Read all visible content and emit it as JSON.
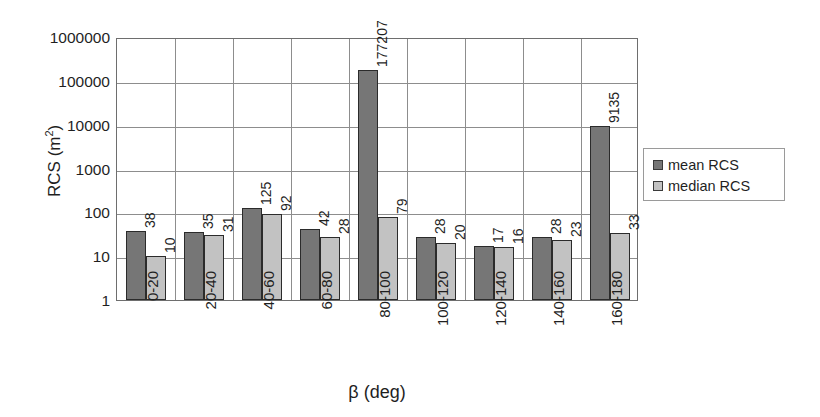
{
  "chart_data": {
    "type": "bar",
    "title": "",
    "xlabel": "β (deg)",
    "ylabel": "RCS (m²)",
    "ylabel_base": "RCS (m",
    "ylabel_sup": "2",
    "ylabel_tail": ")",
    "yscale": "log",
    "ylim": [
      1,
      1000000
    ],
    "ytick_labels": [
      "1000000",
      "100000",
      "10000",
      "1000",
      "100",
      "10",
      "1"
    ],
    "ytick_values": [
      1000000,
      100000,
      10000,
      1000,
      100,
      10,
      1
    ],
    "grid": "horizontal-and-vertical",
    "legend_position": "right-outside",
    "categories": [
      "0-20",
      "20-40",
      "40-60",
      "60-80",
      "80-100",
      "100-120",
      "120-140",
      "140-160",
      "160-180"
    ],
    "series": [
      {
        "name": "mean RCS",
        "color": "#767676",
        "values": [
          38,
          35,
          125,
          42,
          177207,
          28,
          17,
          28,
          9135
        ],
        "labels": [
          "38",
          "35",
          "125",
          "42",
          "177207",
          "28",
          "17",
          "28",
          "9135"
        ]
      },
      {
        "name": "median RCS",
        "color": "#c2c2c2",
        "values": [
          10,
          31,
          92,
          28,
          79,
          20,
          16,
          23,
          33
        ],
        "labels": [
          "10",
          "31",
          "92",
          "28",
          "79",
          "20",
          "16",
          "23",
          "33"
        ]
      }
    ]
  },
  "legend": {
    "items": [
      {
        "label": "mean RCS",
        "color": "#767676"
      },
      {
        "label": "median RCS",
        "color": "#c2c2c2"
      }
    ]
  }
}
